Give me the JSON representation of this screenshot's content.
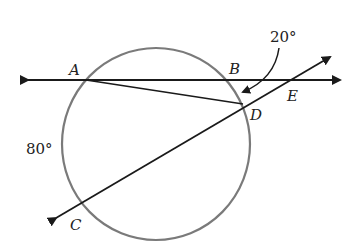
{
  "diagram": {
    "type": "circle-secant-geometry",
    "colors": {
      "circle": "#7a7a7a",
      "lines": "#1a1a1a",
      "text": "#222222",
      "background": "#ffffff"
    },
    "points": {
      "A": "A",
      "B": "B",
      "C": "C",
      "D": "D",
      "E": "E"
    },
    "angles": {
      "angle_at_D_label": "20°",
      "arc_label": "80°"
    },
    "elements": [
      "circle",
      "line AE (horizontal, double-headed)",
      "line CE (secant through C and D, double-headed)",
      "segment AD",
      "curved pointer arrow from 20° label to angle near D"
    ]
  }
}
